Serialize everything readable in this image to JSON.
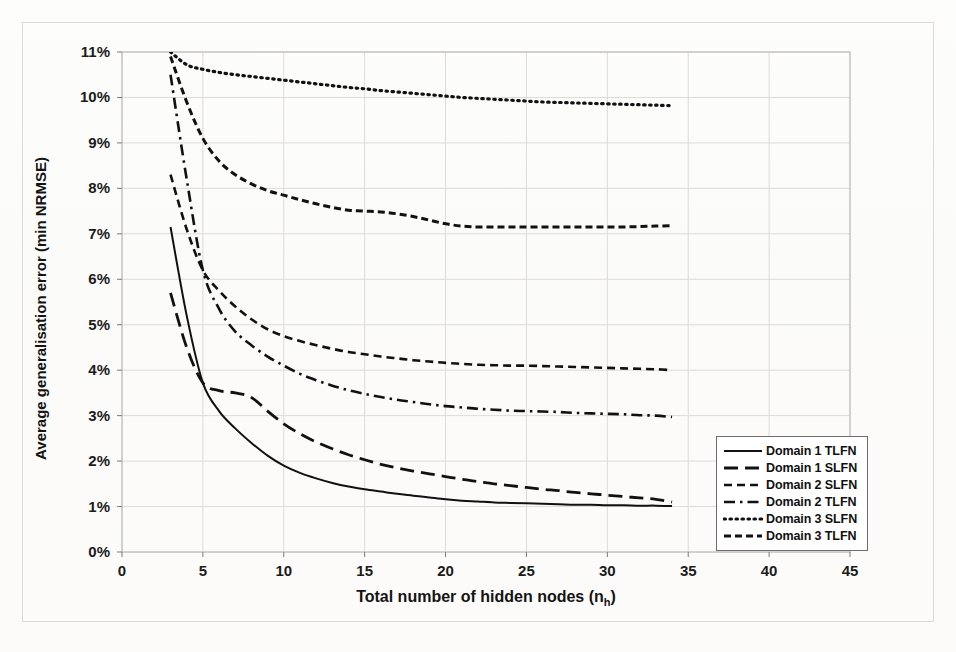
{
  "chart_data": {
    "type": "line",
    "title": "",
    "xlabel": "Total number of hidden nodes (n_h)",
    "xlabel_main": "Total number of hidden nodes (n",
    "xlabel_sub": "h",
    "xlabel_tail": ")",
    "ylabel": "Average generalisation error (min NRMSE)",
    "xlim": [
      0,
      45
    ],
    "ylim": [
      0,
      11
    ],
    "xticks": [
      "0",
      "5",
      "10",
      "15",
      "20",
      "25",
      "30",
      "35",
      "40",
      "45"
    ],
    "xtick_values": [
      0,
      5,
      10,
      15,
      20,
      25,
      30,
      35,
      40,
      45
    ],
    "yticks": [
      "0%",
      "1%",
      "2%",
      "3%",
      "4%",
      "5%",
      "6%",
      "7%",
      "8%",
      "9%",
      "10%",
      "11%"
    ],
    "ytick_values": [
      0,
      1,
      2,
      3,
      4,
      5,
      6,
      7,
      8,
      9,
      10,
      11
    ],
    "grid": true,
    "legend_position": "bottom-right",
    "x": [
      3,
      4,
      5,
      6,
      7,
      8,
      9,
      10,
      11,
      12,
      13,
      14,
      15,
      16,
      17,
      18,
      19,
      20,
      21,
      22,
      23,
      24,
      25,
      26,
      27,
      28,
      29,
      30,
      31,
      32,
      33,
      34
    ],
    "series": [
      {
        "name": "Domain 1 TLFN",
        "style": "solid",
        "color": "#111111",
        "values": [
          7.15,
          5.2,
          3.72,
          3.1,
          2.72,
          2.4,
          2.12,
          1.9,
          1.74,
          1.62,
          1.52,
          1.44,
          1.38,
          1.33,
          1.28,
          1.24,
          1.2,
          1.16,
          1.13,
          1.11,
          1.09,
          1.08,
          1.07,
          1.06,
          1.05,
          1.04,
          1.04,
          1.03,
          1.03,
          1.02,
          1.02,
          1.01
        ]
      },
      {
        "name": "Domain 1 SLFN",
        "style": "long-dash",
        "color": "#111111",
        "values": [
          5.7,
          4.5,
          3.72,
          3.55,
          3.5,
          3.4,
          3.1,
          2.82,
          2.6,
          2.42,
          2.27,
          2.14,
          2.03,
          1.93,
          1.85,
          1.78,
          1.72,
          1.66,
          1.6,
          1.55,
          1.5,
          1.46,
          1.42,
          1.38,
          1.35,
          1.31,
          1.28,
          1.25,
          1.22,
          1.19,
          1.16,
          1.1
        ]
      },
      {
        "name": "Domain 2 SLFN",
        "style": "short-dash",
        "color": "#111111",
        "values": [
          8.3,
          7.1,
          6.2,
          5.75,
          5.4,
          5.12,
          4.9,
          4.75,
          4.64,
          4.55,
          4.47,
          4.4,
          4.35,
          4.3,
          4.26,
          4.22,
          4.19,
          4.16,
          4.14,
          4.12,
          4.11,
          4.1,
          4.1,
          4.09,
          4.08,
          4.07,
          4.06,
          4.05,
          4.04,
          4.03,
          4.02,
          4.0
        ]
      },
      {
        "name": "Domain 2 TLFN",
        "style": "dash-dot",
        "color": "#111111",
        "values": [
          10.5,
          8.2,
          6.2,
          5.35,
          4.85,
          4.55,
          4.3,
          4.1,
          3.92,
          3.78,
          3.66,
          3.56,
          3.48,
          3.41,
          3.35,
          3.3,
          3.25,
          3.21,
          3.18,
          3.15,
          3.13,
          3.11,
          3.1,
          3.09,
          3.08,
          3.06,
          3.05,
          3.04,
          3.03,
          3.01,
          3.0,
          2.97
        ]
      },
      {
        "name": "Domain 3 SLFN",
        "style": "dotted",
        "color": "#111111",
        "values": [
          11.0,
          10.72,
          10.62,
          10.55,
          10.5,
          10.46,
          10.42,
          10.38,
          10.34,
          10.3,
          10.26,
          10.22,
          10.19,
          10.15,
          10.12,
          10.09,
          10.06,
          10.03,
          10.0,
          9.98,
          9.96,
          9.94,
          9.92,
          9.9,
          9.89,
          9.88,
          9.87,
          9.86,
          9.85,
          9.84,
          9.83,
          9.82
        ]
      },
      {
        "name": "Domain 3 TLFN",
        "style": "med-dash",
        "color": "#111111",
        "values": [
          10.9,
          9.9,
          9.1,
          8.6,
          8.3,
          8.1,
          7.95,
          7.85,
          7.75,
          7.66,
          7.58,
          7.52,
          7.5,
          7.48,
          7.44,
          7.38,
          7.3,
          7.22,
          7.17,
          7.15,
          7.15,
          7.15,
          7.15,
          7.15,
          7.15,
          7.15,
          7.15,
          7.15,
          7.15,
          7.16,
          7.17,
          7.18
        ]
      }
    ]
  },
  "legend": {
    "items": [
      {
        "label": "Domain 1 TLFN",
        "style": "solid"
      },
      {
        "label": "Domain 1 SLFN",
        "style": "long-dash"
      },
      {
        "label": "Domain 2 SLFN",
        "style": "short-dash"
      },
      {
        "label": "Domain 2 TLFN",
        "style": "dash-dot"
      },
      {
        "label": "Domain 3 SLFN",
        "style": "dotted"
      },
      {
        "label": "Domain 3 TLFN",
        "style": "med-dash"
      }
    ]
  }
}
